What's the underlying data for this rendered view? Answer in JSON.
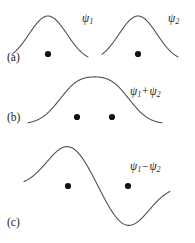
{
  "figure": {
    "name": "molecular-orbital-combination-figure",
    "width": 195,
    "height": 243,
    "background_color": "#ffffff",
    "curve_color": "#4a4a4a",
    "nucleus_color": "#111111",
    "text_color": "#1a1a1a"
  },
  "panels": [
    {
      "id": "a",
      "label": "(a)",
      "description": "two separate atomic wavefunctions",
      "curve_labels": [
        "psi-1",
        "psi-2"
      ],
      "nuclei_count": 2
    },
    {
      "id": "b",
      "label": "(b)",
      "description": "bonding combination, in-phase sum",
      "curve_labels": [
        "psi-1-plus-psi-2"
      ],
      "nuclei_count": 2
    },
    {
      "id": "c",
      "label": "(c)",
      "description": "antibonding combination, out-of-phase difference",
      "curve_labels": [
        "psi-1-minus-psi-2"
      ],
      "nuclei_count": 2
    }
  ],
  "labels": {
    "panel_a": "(a)",
    "panel_b": "(b)",
    "panel_c": "(c)",
    "psi": "ψ",
    "sub_1": "1",
    "sub_2": "2",
    "plus": "+",
    "minus": "−"
  },
  "chart_data": {
    "type": "line",
    "title": "",
    "xlabel": "",
    "ylabel": "",
    "grid": false,
    "legend": "none",
    "xlim": [
      0,
      195
    ],
    "ylim": [
      243,
      0
    ],
    "annotations": [
      {
        "text": "(a)",
        "x": 7,
        "y": 52
      },
      {
        "text": "ψ₁",
        "x": 82,
        "y": 13
      },
      {
        "text": "ψ₂",
        "x": 168,
        "y": 13
      },
      {
        "text": "(b)",
        "x": 7,
        "y": 112
      },
      {
        "text": "ψ₁ + ψ₂",
        "x": 130,
        "y": 86
      },
      {
        "text": "(c)",
        "x": 7,
        "y": 217
      },
      {
        "text": "ψ₁ − ψ₂",
        "x": 130,
        "y": 161
      }
    ],
    "series": [
      {
        "name": "psi-1",
        "panel": "a",
        "center": 48,
        "baseline": 62,
        "amplitude": 46,
        "width": 19,
        "sign": 1,
        "x_range": [
          12,
          88
        ]
      },
      {
        "name": "psi-2",
        "panel": "a",
        "center": 138,
        "baseline": 62,
        "amplitude": 46,
        "width": 19,
        "sign": 1,
        "x_range": [
          102,
          178
        ]
      },
      {
        "name": "psi-1-plus-psi-2",
        "panel": "b",
        "baseline": 124,
        "centers": [
          77,
          112
        ],
        "amplitude": 36,
        "width": 19,
        "signs": [
          1,
          1
        ],
        "x_range": [
          28,
          162
        ]
      },
      {
        "name": "psi-1-minus-psi-2",
        "panel": "c",
        "baseline": 186,
        "centers": [
          68,
          128
        ],
        "amplitude": 40,
        "width": 21,
        "signs": [
          1,
          -1
        ],
        "x_range": [
          24,
          170
        ]
      }
    ],
    "nuclei": [
      {
        "panel": "a",
        "x": 48,
        "y": 54,
        "r": 3.1
      },
      {
        "panel": "a",
        "x": 138,
        "y": 54,
        "r": 3.1
      },
      {
        "panel": "b",
        "x": 77,
        "y": 117,
        "r": 3.1
      },
      {
        "panel": "b",
        "x": 112,
        "y": 117,
        "r": 3.1
      },
      {
        "panel": "c",
        "x": 68,
        "y": 186,
        "r": 3.1
      },
      {
        "panel": "c",
        "x": 128,
        "y": 186,
        "r": 3.1
      }
    ]
  }
}
